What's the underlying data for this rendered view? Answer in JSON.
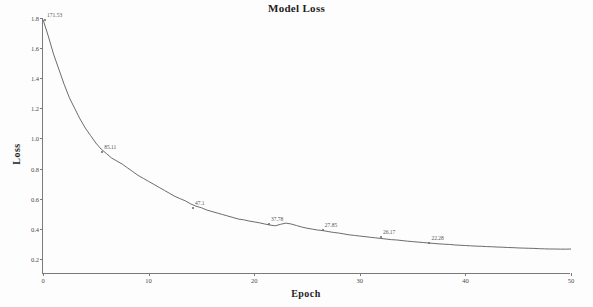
{
  "chart_data": {
    "type": "line",
    "title": "Model Loss",
    "xlabel": "Epoch",
    "ylabel": "Loss",
    "xlim": [
      0,
      50
    ],
    "ylim": [
      0.1,
      1.8
    ],
    "grid": false,
    "legend": null,
    "xticks": [
      "0",
      "10",
      "20",
      "30",
      "40",
      "50"
    ],
    "xtick_values": [
      0,
      10,
      20,
      30,
      40,
      50
    ],
    "yticks": [
      "1.8",
      "1.6",
      "1.4",
      "1.2",
      "1.0",
      "0.8",
      "0.6",
      "0.4",
      "0.2"
    ],
    "ytick_values": [
      1.8,
      1.6,
      1.4,
      1.2,
      1.0,
      0.8,
      0.6,
      0.4,
      0.2
    ],
    "series": [
      {
        "name": "loss",
        "x": [
          0,
          0.5,
          1,
          1.5,
          2,
          2.5,
          3,
          3.5,
          4,
          4.5,
          5,
          5.5,
          6,
          6.5,
          7,
          7.5,
          8,
          8.5,
          9,
          9.5,
          10,
          10.5,
          11,
          11.5,
          12,
          12.5,
          13,
          13.5,
          14,
          14.5,
          15,
          15.5,
          16,
          16.5,
          17,
          17.5,
          18,
          18.5,
          19,
          19.5,
          20,
          20.5,
          21,
          21.5,
          22,
          22.5,
          23,
          23.5,
          24,
          24.5,
          25,
          25.5,
          26,
          26.5,
          27,
          27.5,
          28,
          28.5,
          29,
          29.5,
          30,
          30.5,
          31,
          31.5,
          32,
          32.5,
          33,
          33.5,
          34,
          34.5,
          35,
          35.5,
          36,
          36.5,
          37,
          37.5,
          38,
          38.5,
          39,
          39.5,
          40,
          40.5,
          41,
          41.5,
          42,
          42.5,
          43,
          43.5,
          44,
          44.5,
          45,
          45.5,
          46,
          46.5,
          47,
          47.5,
          48,
          48.5,
          49,
          49.5,
          50
        ],
        "y": [
          1.79,
          1.68,
          1.56,
          1.46,
          1.36,
          1.27,
          1.2,
          1.13,
          1.07,
          1.02,
          0.97,
          0.93,
          0.9,
          0.87,
          0.85,
          0.83,
          0.805,
          0.78,
          0.755,
          0.735,
          0.715,
          0.695,
          0.675,
          0.655,
          0.635,
          0.615,
          0.6,
          0.585,
          0.565,
          0.55,
          0.54,
          0.525,
          0.515,
          0.505,
          0.495,
          0.485,
          0.475,
          0.465,
          0.46,
          0.452,
          0.446,
          0.44,
          0.432,
          0.425,
          0.42,
          0.43,
          0.438,
          0.432,
          0.422,
          0.412,
          0.404,
          0.398,
          0.392,
          0.388,
          0.382,
          0.376,
          0.372,
          0.366,
          0.36,
          0.356,
          0.352,
          0.348,
          0.344,
          0.34,
          0.336,
          0.332,
          0.328,
          0.326,
          0.322,
          0.318,
          0.315,
          0.312,
          0.309,
          0.306,
          0.303,
          0.3,
          0.298,
          0.296,
          0.293,
          0.291,
          0.289,
          0.287,
          0.285,
          0.284,
          0.282,
          0.281,
          0.279,
          0.278,
          0.276,
          0.275,
          0.273,
          0.272,
          0.271,
          0.27,
          0.268,
          0.267,
          0.266,
          0.266,
          0.265,
          0.265,
          0.266
        ]
      }
    ],
    "annotations": [
      {
        "label": "171.53",
        "x": 0.2,
        "y": 1.79
      },
      {
        "label": "85.11",
        "x": 5.6,
        "y": 0.91
      },
      {
        "label": "47.1",
        "x": 14.2,
        "y": 0.54
      },
      {
        "label": "37.78",
        "x": 21.4,
        "y": 0.43
      },
      {
        "label": "27.85",
        "x": 26.5,
        "y": 0.39
      },
      {
        "label": "26.17",
        "x": 32.0,
        "y": 0.345
      },
      {
        "label": "22.28",
        "x": 36.6,
        "y": 0.307
      }
    ]
  }
}
